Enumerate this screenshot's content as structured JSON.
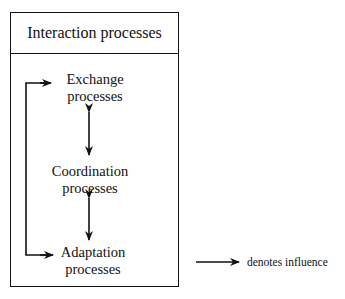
{
  "diagram": {
    "title": "Interaction processes",
    "nodes": [
      {
        "id": "exchange",
        "line1": "Exchange",
        "line2": "processes"
      },
      {
        "id": "coordination",
        "line1": "Coordination",
        "line2": "processes"
      },
      {
        "id": "adaptation",
        "line1": "Adaptation",
        "line2": "processes"
      }
    ],
    "edges": [
      {
        "from": "exchange",
        "to": "coordination",
        "type": "bidirectional"
      },
      {
        "from": "coordination",
        "to": "adaptation",
        "type": "bidirectional"
      },
      {
        "from": "adaptation",
        "to": "exchange",
        "type": "feedback-loop",
        "via": "left-bracket",
        "heads": [
          "exchange",
          "adaptation"
        ]
      }
    ],
    "legend": {
      "symbol": "arrow",
      "label": "denotes influence"
    },
    "colors": {
      "stroke": "#111111",
      "background": "#ffffff"
    }
  }
}
